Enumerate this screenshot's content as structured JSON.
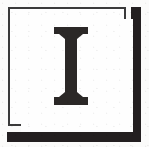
{
  "artifact": {
    "kind": "printed-decorative-initial",
    "medium": "scanned-page-fragment",
    "background_color": "#fbfbfa"
  },
  "initial": {
    "character": "I",
    "style": "serif-capital",
    "ink_color": "#2b2827",
    "description": "capital letter I with wide flat slab serifs top and bottom"
  },
  "frame": {
    "name": "thin-rule-border",
    "line_color": "#3a3a3a",
    "fill_color": "#fefefe",
    "shape": "rectangle"
  },
  "shadow": {
    "name": "offset-shadow-slab",
    "color": "#231f20",
    "edges": [
      "right",
      "bottom"
    ]
  }
}
